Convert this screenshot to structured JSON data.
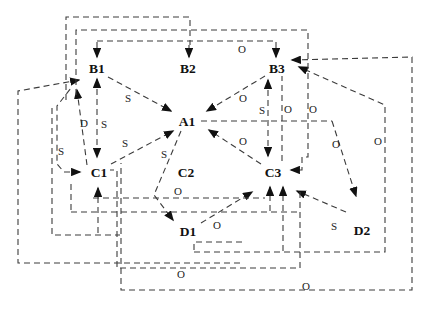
{
  "figure": {
    "canvas": {
      "width": 434,
      "height": 315,
      "background": "#ffffff",
      "line_color": "#3c3c3c",
      "arrow_color": "#111111",
      "node_color": "#111111",
      "label_color": "#222222",
      "dash_pattern": "6 4",
      "node_font_size": 13.5,
      "label_font_size": 11
    },
    "nodes": [
      {
        "id": "B1",
        "label": "B1",
        "x": 97,
        "y": 68
      },
      {
        "id": "B2",
        "label": "B2",
        "x": 188,
        "y": 68
      },
      {
        "id": "B3",
        "label": "B3",
        "x": 277,
        "y": 68
      },
      {
        "id": "A1",
        "label": "A1",
        "x": 187,
        "y": 121
      },
      {
        "id": "C1",
        "label": "C1",
        "x": 99,
        "y": 172
      },
      {
        "id": "C2",
        "label": "C2",
        "x": 186,
        "y": 172
      },
      {
        "id": "C3",
        "label": "C3",
        "x": 273,
        "y": 172
      },
      {
        "id": "D1",
        "label": "D1",
        "x": 188,
        "y": 231
      },
      {
        "id": "D2",
        "label": "D2",
        "x": 362,
        "y": 230
      }
    ],
    "connections": [
      {
        "name": "top-feed-b1",
        "points": [
          [
            97,
            42
          ],
          [
            97,
            57
          ]
        ],
        "arrow_start": false,
        "arrow_end": true,
        "label": null
      },
      {
        "name": "top-feed-b2",
        "points": [
          [
            189,
            45
          ],
          [
            189,
            57
          ]
        ],
        "arrow_start": false,
        "arrow_end": true,
        "label": null
      },
      {
        "name": "top-feed-b3",
        "points": [
          [
            276,
            42
          ],
          [
            276,
            57
          ]
        ],
        "arrow_start": false,
        "arrow_end": true,
        "label": null
      },
      {
        "name": "b1-c1-vertical",
        "points": [
          [
            97,
            79
          ],
          [
            97,
            157
          ]
        ],
        "arrow_start": true,
        "arrow_end": true,
        "label": {
          "text": "S",
          "x": 104,
          "y": 124
        }
      },
      {
        "name": "c1-b1-diagonal",
        "points": [
          [
            87,
            165
          ],
          [
            77,
            90
          ]
        ],
        "arrow_start": false,
        "arrow_end": true,
        "label": {
          "text": "D",
          "x": 84,
          "y": 123
        }
      },
      {
        "name": "b1-a1",
        "points": [
          [
            108,
            77
          ],
          [
            171,
            111
          ]
        ],
        "arrow_start": false,
        "arrow_end": true,
        "label": {
          "text": "S",
          "x": 128,
          "y": 98
        }
      },
      {
        "name": "c1-a1",
        "points": [
          [
            111,
            164
          ],
          [
            173,
            131
          ]
        ],
        "arrow_start": false,
        "arrow_end": true,
        "label": {
          "text": "S",
          "x": 125,
          "y": 143
        }
      },
      {
        "name": "b3-a1",
        "points": [
          [
            265,
            76
          ],
          [
            207,
            111
          ]
        ],
        "arrow_start": false,
        "arrow_end": true,
        "label": {
          "text": "O",
          "x": 243,
          "y": 98
        }
      },
      {
        "name": "c3-a1",
        "points": [
          [
            261,
            164
          ],
          [
            209,
            130
          ]
        ],
        "arrow_start": false,
        "arrow_end": true,
        "label": {
          "text": "O",
          "x": 243,
          "y": 141
        }
      },
      {
        "name": "a1-d1",
        "points": [
          [
            181,
            131
          ],
          [
            154,
            195
          ],
          [
            173,
            220
          ]
        ],
        "arrow_start": false,
        "arrow_end": true,
        "label": {
          "text": "S",
          "x": 164,
          "y": 154
        }
      },
      {
        "name": "b3-c3-vertical",
        "points": [
          [
            268,
            80
          ],
          [
            268,
            156
          ]
        ],
        "arrow_start": true,
        "arrow_end": true,
        "label": {
          "text": "S",
          "x": 262,
          "y": 110
        }
      },
      {
        "name": "d1-c3",
        "points": [
          [
            201,
            223
          ],
          [
            252,
            192
          ]
        ],
        "arrow_start": false,
        "arrow_end": true,
        "label": {
          "text": "O",
          "x": 217,
          "y": 225
        }
      },
      {
        "name": "d2-c3",
        "points": [
          [
            346,
            212
          ],
          [
            297,
            191
          ]
        ],
        "arrow_start": false,
        "arrow_end": true,
        "label": {
          "text": "S",
          "x": 334,
          "y": 226
        }
      },
      {
        "name": "a1line-d2",
        "points": [
          [
            332,
            121
          ],
          [
            356,
            196
          ]
        ],
        "arrow_start": false,
        "arrow_end": true,
        "label": {
          "text": "O",
          "x": 336,
          "y": 144
        }
      },
      {
        "name": "box-feed-c3-left",
        "points": [
          [
            270,
            211
          ],
          [
            270,
            187
          ]
        ],
        "arrow_start": false,
        "arrow_end": true,
        "label": null
      },
      {
        "name": "box-feed-c3-right",
        "points": [
          [
            283,
            251
          ],
          [
            283,
            187
          ]
        ],
        "arrow_start": false,
        "arrow_end": true,
        "label": null
      },
      {
        "name": "c1-b1-left-route",
        "points": [
          [
            80,
            172
          ],
          [
            64,
            172
          ],
          [
            57,
            164
          ],
          [
            57,
            106
          ],
          [
            71,
            88
          ]
        ],
        "arrow_start": true,
        "arrow_end": false,
        "label": {
          "text": "S",
          "x": 61,
          "y": 151
        }
      },
      {
        "name": "loop-left-b1",
        "points": [
          [
            79,
            80
          ],
          [
            18,
            91
          ],
          [
            18,
            263
          ],
          [
            240,
            263
          ]
        ],
        "arrow_start": true,
        "arrow_end": false,
        "label": null
      },
      {
        "name": "loop-right-b3",
        "points": [
          [
            194,
            252
          ],
          [
            385,
            252
          ],
          [
            385,
            105
          ],
          [
            299,
            67
          ]
        ],
        "arrow_start": false,
        "arrow_end": true,
        "label": {
          "text": "O",
          "x": 378,
          "y": 141
        }
      },
      {
        "name": "outer-right-b3",
        "points": [
          [
            292,
            60
          ],
          [
            412,
            57
          ],
          [
            412,
            290
          ],
          [
            121,
            290
          ],
          [
            121,
            163
          ]
        ],
        "arrow_start": true,
        "arrow_end": false,
        "label": {
          "text": "O",
          "x": 306,
          "y": 286
        }
      },
      {
        "name": "box-bracket-c3",
        "points": [
          [
            76,
            95
          ],
          [
            76,
            30
          ],
          [
            308,
            30
          ],
          [
            308,
            157
          ],
          [
            302,
            157
          ],
          [
            302,
            170
          ],
          [
            291,
            170
          ]
        ],
        "arrow_start": false,
        "arrow_end": true,
        "label": {
          "text": "O",
          "x": 313,
          "y": 109
        }
      },
      {
        "name": "box-top-b1b2",
        "points": [
          [
            66,
            100
          ],
          [
            66,
            17
          ],
          [
            190,
            17
          ],
          [
            190,
            45
          ]
        ],
        "arrow_start": false,
        "arrow_end": false,
        "label": null
      },
      {
        "name": "top-line",
        "points": [
          [
            97,
            41
          ],
          [
            276,
            41
          ]
        ],
        "arrow_start": false,
        "arrow_end": false,
        "label": {
          "text": "O",
          "x": 242,
          "y": 49
        }
      },
      {
        "name": "b3-c3-line2",
        "points": [
          [
            282,
            75
          ],
          [
            282,
            162
          ]
        ],
        "arrow_start": false,
        "arrow_end": false,
        "label": {
          "text": "O",
          "x": 288,
          "y": 109
        }
      },
      {
        "name": "a1-right-line",
        "points": [
          [
            201,
            121
          ],
          [
            332,
            121
          ]
        ],
        "arrow_start": false,
        "arrow_end": false,
        "label": null
      },
      {
        "name": "line-under-c2",
        "points": [
          [
            93,
            198
          ],
          [
            265,
            198
          ]
        ],
        "arrow_start": false,
        "arrow_end": false,
        "label": {
          "text": "O",
          "x": 178,
          "y": 191
        }
      },
      {
        "name": "line-212",
        "points": [
          [
            71,
            212
          ],
          [
            300,
            212
          ]
        ],
        "arrow_start": false,
        "arrow_end": false,
        "label": null
      },
      {
        "name": "below-feed-c1",
        "points": [
          [
            98,
            233
          ],
          [
            98,
            188
          ]
        ],
        "arrow_start": false,
        "arrow_end": true,
        "label": null
      },
      {
        "name": "c1-left-stub",
        "points": [
          [
            71,
            184
          ],
          [
            71,
            212
          ]
        ],
        "arrow_start": false,
        "arrow_end": false,
        "label": null
      },
      {
        "name": "box-left-small",
        "points": [
          [
            52,
            108
          ],
          [
            52,
            235
          ],
          [
            120,
            235
          ]
        ],
        "arrow_start": false,
        "arrow_end": false,
        "label": null
      },
      {
        "name": "box-c2-d1",
        "points": [
          [
            108,
            170
          ],
          [
            117,
            170
          ],
          [
            117,
            268
          ],
          [
            300,
            268
          ],
          [
            300,
            192
          ]
        ],
        "arrow_start": false,
        "arrow_end": false,
        "label": {
          "text": "O",
          "x": 181,
          "y": 274
        }
      },
      {
        "name": "box-d1",
        "points": [
          [
            242,
            242
          ],
          [
            194,
            242
          ],
          [
            194,
            252
          ]
        ],
        "arrow_start": false,
        "arrow_end": false,
        "label": null
      }
    ]
  }
}
